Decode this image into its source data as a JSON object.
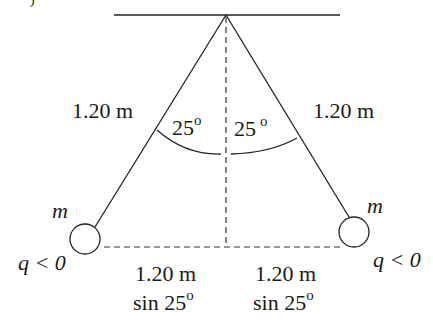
{
  "figure": {
    "partial_label": ")",
    "left": {
      "string_length_label": "1.20 m",
      "angle_value": "25",
      "angle_unit": "o",
      "mass_label": "m",
      "charge_label": "q < 0",
      "horizontal_label_line1": "1.20 m",
      "horizontal_label_line2": "sin 25",
      "horizontal_label_sup": "o"
    },
    "right": {
      "string_length_label": "1.20 m",
      "angle_value": "25",
      "angle_unit": "o",
      "mass_label": "m",
      "charge_label": "q < 0",
      "horizontal_label_line1": "1.20 m",
      "horizontal_label_line2": "sin 25",
      "horizontal_label_sup": "o"
    },
    "colors": {
      "line": "#222222",
      "text": "#1a1a1a",
      "background": "#ffffff"
    }
  }
}
